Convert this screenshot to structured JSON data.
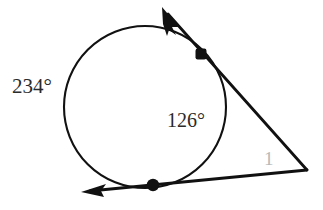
{
  "figure": {
    "background_color": "#ffffff",
    "stroke_color": "#111111",
    "labels": {
      "major_arc": "234°",
      "minor_arc": "126°",
      "angle_number": "1"
    },
    "label_colors": {
      "major_arc": "#2b2b2b",
      "minor_arc": "#2b2b2b",
      "angle_number": "#b9b9b9"
    },
    "circle": {
      "center_x": 145,
      "center_y": 107,
      "radius": 81
    },
    "points": {
      "upper_tangent_point": {
        "x": 201,
        "y": 54
      },
      "lower_tangent_point": {
        "x": 153,
        "y": 185
      },
      "external_vertex": {
        "x": 307,
        "y": 170
      }
    },
    "tangent_lines": [
      {
        "name": "upper-tangent-line",
        "from_x": 163,
        "from_y": 8,
        "to_x": 307,
        "to_y": 170,
        "arrow_end": "start"
      },
      {
        "name": "lower-tangent-line",
        "from_x": 307,
        "from_y": 170,
        "to_x": 82,
        "to_y": 192,
        "arrow_end": "end"
      }
    ],
    "label_positions": {
      "major_arc": {
        "x": 12,
        "y": 93
      },
      "minor_arc": {
        "x": 167,
        "y": 127
      },
      "angle_number": {
        "x": 264,
        "y": 165
      }
    }
  }
}
